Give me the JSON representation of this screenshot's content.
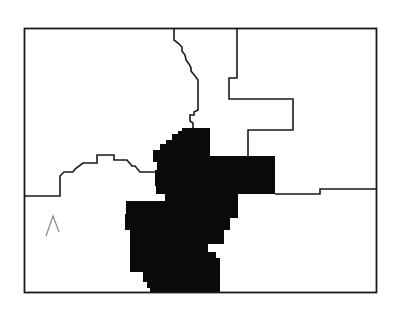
{
  "map": {
    "type": "county-region-map",
    "colors": {
      "background": "#ffffff",
      "border": "#1a1a1a",
      "highlight_fill": "#0a0a0a",
      "faint_mark": "#888888"
    },
    "frame": {
      "x": 24,
      "y": 28,
      "width": 352,
      "height": 265
    },
    "regions": [
      {
        "id": "northwest",
        "highlighted": false
      },
      {
        "id": "north-central",
        "highlighted": false
      },
      {
        "id": "northeast",
        "highlighted": false
      },
      {
        "id": "southwest",
        "highlighted": false
      },
      {
        "id": "southeast",
        "highlighted": false
      },
      {
        "id": "central",
        "highlighted": true
      }
    ],
    "marks": [
      {
        "id": "faint-caret-mark",
        "text": "ʌ",
        "x": 46,
        "y": 212
      }
    ]
  }
}
